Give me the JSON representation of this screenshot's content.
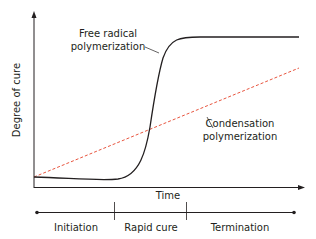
{
  "diagram": {
    "y_axis_label": "Degree of cure",
    "x_axis_label": "Time",
    "curves": [
      {
        "name": "Free radical polymerization",
        "label_line1": "Free radical",
        "label_line2": "polymerization",
        "color": "#231f20",
        "style": "solid",
        "shape": "sigmoid"
      },
      {
        "name": "Condensation polymerization",
        "label_line1": "Condensation",
        "label_line2": "polymerization",
        "color": "#e8553f",
        "style": "dashed",
        "shape": "linear"
      }
    ],
    "phases": [
      {
        "label": "Initiation"
      },
      {
        "label": "Rapid cure"
      },
      {
        "label": "Termination"
      }
    ]
  },
  "colors": {
    "axis": "#231f20",
    "free_radical": "#231f20",
    "condensation": "#e8553f"
  }
}
